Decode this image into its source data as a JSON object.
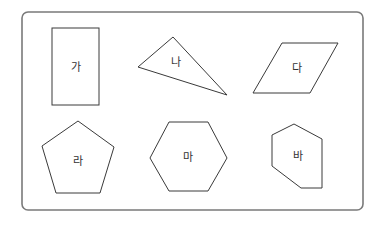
{
  "diagram": {
    "title": "",
    "shapes": [
      {
        "id": "ga",
        "label": "가",
        "type": "rectangle"
      },
      {
        "id": "na",
        "label": "나",
        "type": "triangle"
      },
      {
        "id": "da",
        "label": "다",
        "type": "parallelogram"
      },
      {
        "id": "ra",
        "label": "라",
        "type": "pentagon"
      },
      {
        "id": "ma",
        "label": "마",
        "type": "hexagon"
      },
      {
        "id": "ba",
        "label": "바",
        "type": "hexagon-irregular"
      }
    ],
    "colors": {
      "frame_stroke": "#7a7a7a",
      "shape_stroke": "#3a3a3a",
      "label": "#333333",
      "background": "#ffffff"
    }
  }
}
